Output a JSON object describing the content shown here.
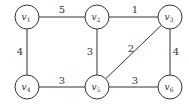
{
  "graph": {
    "nodes": [
      {
        "id": "v1",
        "name": "v",
        "sub": "1",
        "x": 27,
        "y": 17
      },
      {
        "id": "v2",
        "name": "v",
        "sub": "2",
        "x": 97,
        "y": 17
      },
      {
        "id": "v3",
        "name": "v",
        "sub": "3",
        "x": 170,
        "y": 17
      },
      {
        "id": "v4",
        "name": "v",
        "sub": "4",
        "x": 27,
        "y": 87
      },
      {
        "id": "v5",
        "name": "v",
        "sub": "5",
        "x": 97,
        "y": 87
      },
      {
        "id": "v6",
        "name": "v",
        "sub": "6",
        "x": 170,
        "y": 87
      }
    ],
    "edges": [
      {
        "from": "v1",
        "to": "v2",
        "weight": "5",
        "lx": 62,
        "ly": 13
      },
      {
        "from": "v2",
        "to": "v3",
        "weight": "1",
        "lx": 135,
        "ly": 13
      },
      {
        "from": "v1",
        "to": "v4",
        "weight": "4",
        "lx": 20,
        "ly": 55
      },
      {
        "from": "v2",
        "to": "v5",
        "weight": "3",
        "lx": 90,
        "ly": 55
      },
      {
        "from": "v3",
        "to": "v5",
        "weight": "2",
        "lx": 131,
        "ly": 52
      },
      {
        "from": "v3",
        "to": "v6",
        "weight": "4",
        "lx": 176,
        "ly": 55
      },
      {
        "from": "v4",
        "to": "v5",
        "weight": "3",
        "lx": 62,
        "ly": 84
      },
      {
        "from": "v5",
        "to": "v6",
        "weight": "3",
        "lx": 135,
        "ly": 84
      }
    ]
  }
}
